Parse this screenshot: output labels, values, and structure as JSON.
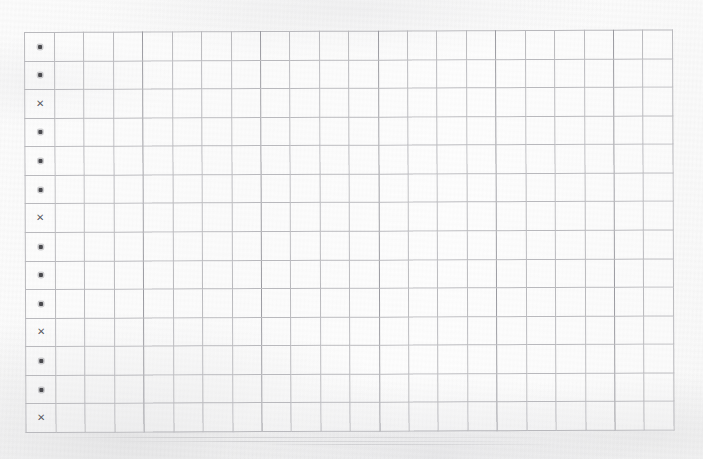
{
  "document": {
    "kind": "scanned-grid-sheet",
    "background_color": "#fdfdfd",
    "rule_color": "#b9b9bd",
    "mark_color": "#4a4a4e"
  },
  "grid": {
    "rows": 14,
    "columns": 22,
    "left": 24,
    "top": 32,
    "width": 649,
    "height": 401,
    "cell_width": 28.2,
    "cell_height": 28.6
  },
  "legend": {
    "dot": "•",
    "cross": "✕",
    "dot_name": "dot-marker",
    "cross_name": "cross-marker"
  },
  "marker_column_index": 0,
  "marker_column": [
    "dot",
    "dot",
    "cross",
    "dot",
    "dot",
    "dot",
    "cross",
    "dot",
    "dot",
    "dot",
    "cross",
    "dot",
    "dot",
    "dot",
    "cross",
    "dot"
  ],
  "rows_marks": [
    "dot",
    "dot",
    "cross",
    "dot",
    "dot",
    "dot",
    "cross",
    "dot",
    "dot",
    "dot",
    "cross",
    "dot",
    "dot",
    "cross",
    "dot"
  ],
  "chart_data": {
    "type": "table",
    "title": "",
    "xlabel": "",
    "ylabel": "",
    "columns": 22,
    "rows": 14,
    "marked_column": 1,
    "column_values": [
      "dot",
      "dot",
      "cross",
      "dot",
      "dot",
      "dot",
      "cross",
      "dot",
      "dot",
      "dot",
      "cross",
      "dot",
      "dot",
      "cross"
    ],
    "grid": true,
    "legend_position": "none"
  },
  "streaks": [
    {
      "left": 40,
      "top": 437,
      "width": 520
    },
    {
      "left": 120,
      "top": 441,
      "width": 420
    },
    {
      "left": 260,
      "top": 444,
      "width": 300
    }
  ]
}
